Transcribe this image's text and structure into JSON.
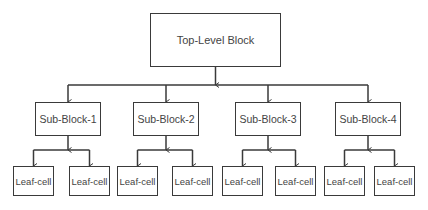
{
  "diagram": {
    "type": "hierarchy-tree",
    "line_color": "#3a3a3a",
    "root": {
      "label": "Top-Level Block",
      "box": {
        "x": 150,
        "y": 13,
        "w": 131,
        "h": 54
      }
    },
    "bus_y": 85,
    "leaf_bus_y": 150,
    "sub_blocks": [
      {
        "label": "Sub-Block-1",
        "box": {
          "x": 35,
          "y": 102,
          "w": 66,
          "h": 34
        },
        "children": [
          {
            "label": "Leaf-cell",
            "box": {
              "x": 13,
              "y": 166,
              "w": 41,
              "h": 30
            }
          },
          {
            "label": "Leaf-cell",
            "box": {
              "x": 69,
              "y": 166,
              "w": 41,
              "h": 30
            }
          }
        ]
      },
      {
        "label": "Sub-Block-2",
        "box": {
          "x": 133,
          "y": 102,
          "w": 66,
          "h": 34
        },
        "children": [
          {
            "label": "Leaf-cell",
            "box": {
              "x": 117,
              "y": 166,
              "w": 41,
              "h": 30
            }
          },
          {
            "label": "Leaf-cell",
            "box": {
              "x": 172,
              "y": 166,
              "w": 41,
              "h": 30
            }
          }
        ]
      },
      {
        "label": "Sub-Block-3",
        "box": {
          "x": 235,
          "y": 102,
          "w": 66,
          "h": 34
        },
        "children": [
          {
            "label": "Leaf-cell",
            "box": {
              "x": 222,
              "y": 166,
              "w": 41,
              "h": 30
            }
          },
          {
            "label": "Leaf-cell",
            "box": {
              "x": 275,
              "y": 166,
              "w": 41,
              "h": 30
            }
          }
        ]
      },
      {
        "label": "Sub-Block-4",
        "box": {
          "x": 335,
          "y": 102,
          "w": 66,
          "h": 34
        },
        "children": [
          {
            "label": "Leaf-cell",
            "box": {
              "x": 324,
              "y": 166,
              "w": 41,
              "h": 30
            }
          },
          {
            "label": "Leaf-cell",
            "box": {
              "x": 374,
              "y": 166,
              "w": 41,
              "h": 30
            }
          }
        ]
      }
    ]
  }
}
